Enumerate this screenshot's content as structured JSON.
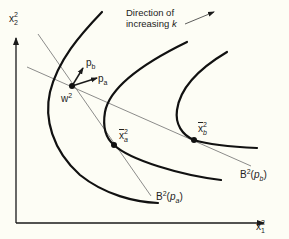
{
  "figure": {
    "background": "#fdfdf5",
    "ink_color": "#1a1a1a",
    "budget_line_color": "#6e6e6e"
  },
  "axes": {
    "y_label": {
      "base": "x",
      "sup": "2",
      "sub": "2"
    },
    "x_label": {
      "base": "x",
      "sup": "2",
      "sub": "1"
    }
  },
  "annotation": {
    "line1": "Direction of",
    "line2_prefix": "increasing ",
    "line2_var": "k"
  },
  "points": {
    "endowment": {
      "base": "w",
      "sup": "2"
    },
    "demand_a": {
      "base": "x",
      "sup": "2",
      "sub": "a"
    },
    "demand_b": {
      "base": "x",
      "sup": "2",
      "sub": "b"
    }
  },
  "price_vectors": {
    "pa": {
      "base": "p",
      "sub": "a"
    },
    "pb": {
      "base": "p",
      "sub": "b"
    }
  },
  "budget_lines": {
    "a": {
      "base": "B",
      "sup": "2",
      "open": "(",
      "arg_base": "p",
      "arg_sub": "a",
      "close": ")"
    },
    "b": {
      "base": "B",
      "sup": "2",
      "open": "(",
      "arg_base": "p",
      "arg_sub": "b",
      "close": ")"
    }
  },
  "indifference_curves": [
    {
      "id": "curve-1"
    },
    {
      "id": "curve-2"
    },
    {
      "id": "curve-3"
    }
  ]
}
